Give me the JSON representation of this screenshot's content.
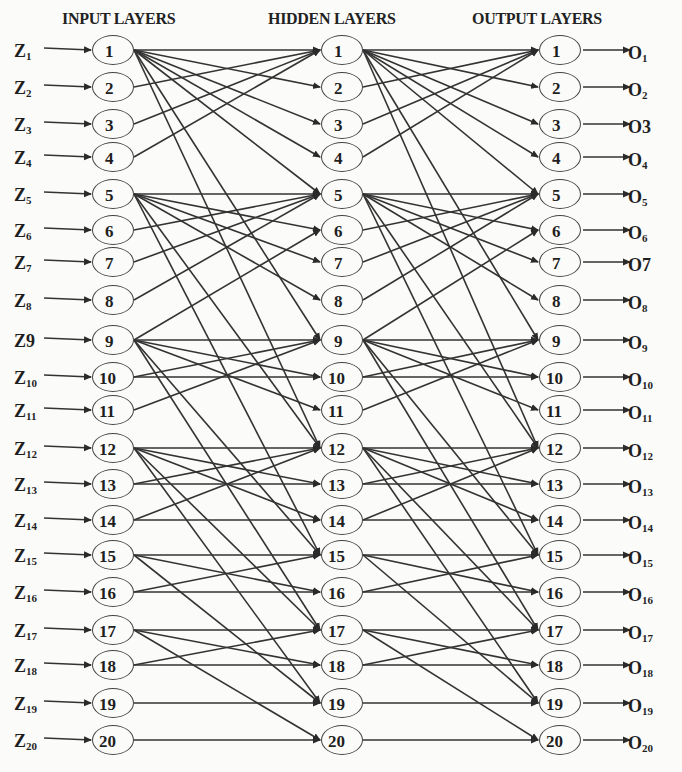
{
  "titles": {
    "input": "INPUT LAYERS",
    "hidden": "HIDDEN LAYERS",
    "output": "OUTPUT LAYERS"
  },
  "colors": {
    "line": "#333333",
    "node_border": "#444444",
    "text": "#1f1f1f",
    "background": "#fbfbfa"
  },
  "inputs": [
    {
      "base": "Z",
      "sub": "1"
    },
    {
      "base": "Z",
      "sub": "2"
    },
    {
      "base": "Z",
      "sub": "3"
    },
    {
      "base": "Z",
      "sub": "4"
    },
    {
      "base": "Z",
      "sub": "5"
    },
    {
      "base": "Z",
      "sub": "6"
    },
    {
      "base": "Z",
      "sub": "7"
    },
    {
      "base": "Z",
      "sub": "8"
    },
    {
      "base": "Z9",
      "sub": ""
    },
    {
      "base": "Z",
      "sub": "10"
    },
    {
      "base": "Z",
      "sub": "11"
    },
    {
      "base": "Z",
      "sub": "12"
    },
    {
      "base": "Z",
      "sub": "13"
    },
    {
      "base": "Z",
      "sub": "14"
    },
    {
      "base": "Z",
      "sub": "15"
    },
    {
      "base": "Z",
      "sub": "16"
    },
    {
      "base": "Z",
      "sub": "17"
    },
    {
      "base": "Z",
      "sub": "18"
    },
    {
      "base": "Z",
      "sub": "19"
    },
    {
      "base": "Z",
      "sub": "20"
    }
  ],
  "outputs": [
    {
      "base": "O",
      "sub": "1"
    },
    {
      "base": "O",
      "sub": "2"
    },
    {
      "base": "O3",
      "sub": ""
    },
    {
      "base": "O",
      "sub": "4"
    },
    {
      "base": "O",
      "sub": "5"
    },
    {
      "base": "O",
      "sub": "6"
    },
    {
      "base": "O7",
      "sub": ""
    },
    {
      "base": "O",
      "sub": "8"
    },
    {
      "base": "O",
      "sub": "9"
    },
    {
      "base": "O",
      "sub": "10"
    },
    {
      "base": "O",
      "sub": "11"
    },
    {
      "base": "O",
      "sub": "12"
    },
    {
      "base": "O",
      "sub": "13"
    },
    {
      "base": "O",
      "sub": "14"
    },
    {
      "base": "O",
      "sub": "15"
    },
    {
      "base": "O",
      "sub": "16"
    },
    {
      "base": "O",
      "sub": "17"
    },
    {
      "base": "O",
      "sub": "18"
    },
    {
      "base": "O",
      "sub": "19"
    },
    {
      "base": "O",
      "sub": "20"
    }
  ],
  "node_labels": [
    "1",
    "2",
    "3",
    "4",
    "5",
    "6",
    "7",
    "8",
    "9",
    "10",
    "11",
    "12",
    "13",
    "14",
    "15",
    "16",
    "17",
    "18",
    "19",
    "20"
  ],
  "layers": {
    "input_x": 113,
    "hidden_x": 342,
    "output_x": 560,
    "node_y": [
      50,
      87,
      124,
      157,
      194,
      230,
      262,
      300,
      340,
      377,
      410,
      448,
      484,
      520,
      555,
      592,
      630,
      665,
      703,
      740
    ]
  },
  "connections": [
    [
      1,
      1
    ],
    [
      1,
      2
    ],
    [
      1,
      3
    ],
    [
      1,
      4
    ],
    [
      1,
      5
    ],
    [
      1,
      9
    ],
    [
      1,
      12
    ],
    [
      2,
      1
    ],
    [
      3,
      1
    ],
    [
      4,
      1
    ],
    [
      5,
      5
    ],
    [
      5,
      6
    ],
    [
      5,
      7
    ],
    [
      5,
      8
    ],
    [
      5,
      12
    ],
    [
      5,
      15
    ],
    [
      6,
      5
    ],
    [
      7,
      5
    ],
    [
      8,
      5
    ],
    [
      9,
      6
    ],
    [
      9,
      9
    ],
    [
      9,
      10
    ],
    [
      9,
      11
    ],
    [
      9,
      15
    ],
    [
      9,
      17
    ],
    [
      10,
      9
    ],
    [
      10,
      10
    ],
    [
      11,
      9
    ],
    [
      12,
      12
    ],
    [
      12,
      13
    ],
    [
      12,
      14
    ],
    [
      12,
      17
    ],
    [
      12,
      19
    ],
    [
      13,
      12
    ],
    [
      13,
      13
    ],
    [
      14,
      12
    ],
    [
      14,
      14
    ],
    [
      15,
      15
    ],
    [
      15,
      16
    ],
    [
      15,
      19
    ],
    [
      16,
      15
    ],
    [
      16,
      16
    ],
    [
      17,
      17
    ],
    [
      17,
      18
    ],
    [
      17,
      20
    ],
    [
      18,
      17
    ],
    [
      18,
      18
    ],
    [
      19,
      19
    ],
    [
      20,
      20
    ]
  ]
}
